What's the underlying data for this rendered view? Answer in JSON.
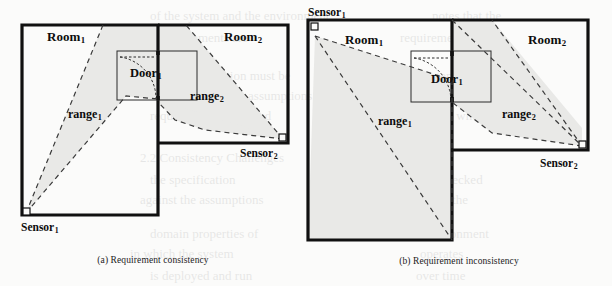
{
  "figure": {
    "type": "technical-diagram",
    "background_color": "#fbfbfa",
    "shade_color": "#e9e9e7",
    "wall_color": "#101010",
    "dash_color": "#3a3a3a"
  },
  "panels": [
    {
      "id": "a",
      "caption": "(a) Requirement consistency",
      "labels": {
        "room1": "Room",
        "room1_sub": "1",
        "room2": "Room",
        "room2_sub": "2",
        "door": "Door",
        "door_sub": "1",
        "range1": "range",
        "range1_sub": "1",
        "range2": "range",
        "range2_sub": "2",
        "sensor1": "Sensor",
        "sensor1_sub": "1",
        "sensor2": "Sensor",
        "sensor2_sub": "2"
      },
      "sensor1_position": "bottom-left corner of Room 1",
      "sensor2_position": "bottom-right corner of Room 2",
      "coverage_note": "Both sensor ranges cover the door region, so the requirement is consistent."
    },
    {
      "id": "b",
      "caption": "(b) Requirement inconsistency",
      "labels": {
        "room1": "Room",
        "room1_sub": "1",
        "room2": "Room",
        "room2_sub": "2",
        "door": "Door",
        "door_sub": "1",
        "range1": "range",
        "range1_sub": "1",
        "range2": "range",
        "range2_sub": "2",
        "sensor1": "Sensor",
        "sensor1_sub": "1",
        "sensor2": "Sensor",
        "sensor2_sub": "2"
      },
      "sensor1_position": "top-left corner of Room 1",
      "sensor2_position": "bottom-right corner of Room 2",
      "coverage_note": "Sensor 1 range sweeps away from the door so the door is not jointly covered; the requirement is inconsistent."
    }
  ],
  "ghost_text": {
    "note": "Faint show-through text from the reverse side of the scanned page",
    "lines": [
      {
        "text": "of the system and the environment",
        "x": 150,
        "y": 6
      },
      {
        "text": "notes that the",
        "x": 432,
        "y": 6
      },
      {
        "text": "and the requirements are",
        "x": 120,
        "y": 28
      },
      {
        "text": "requirements",
        "x": 400,
        "y": 28
      },
      {
        "text": "specification must be",
        "x": 180,
        "y": 66
      },
      {
        "text": "consistent with",
        "x": 404,
        "y": 66
      },
      {
        "text": "the environment assumptions",
        "x": 160,
        "y": 86
      },
      {
        "text": "that the",
        "x": 444,
        "y": 86
      },
      {
        "text": "requirement is satisfied",
        "x": 150,
        "y": 106
      },
      {
        "text": "only when",
        "x": 430,
        "y": 106
      },
      {
        "text": "2.2 Consistency Challenges",
        "x": 140,
        "y": 148
      },
      {
        "text": "the specification",
        "x": 150,
        "y": 170
      },
      {
        "text": "must be checked",
        "x": 396,
        "y": 170
      },
      {
        "text": "against the assumptions",
        "x": 140,
        "y": 190
      },
      {
        "text": "and the",
        "x": 430,
        "y": 190
      },
      {
        "text": "domain properties of",
        "x": 150,
        "y": 224
      },
      {
        "text": "the environment",
        "x": 404,
        "y": 224
      },
      {
        "text": "in which the system",
        "x": 130,
        "y": 244
      },
      {
        "text": "operates",
        "x": 420,
        "y": 244
      },
      {
        "text": "is deployed and run",
        "x": 150,
        "y": 266
      },
      {
        "text": "over time",
        "x": 416,
        "y": 266
      }
    ]
  }
}
